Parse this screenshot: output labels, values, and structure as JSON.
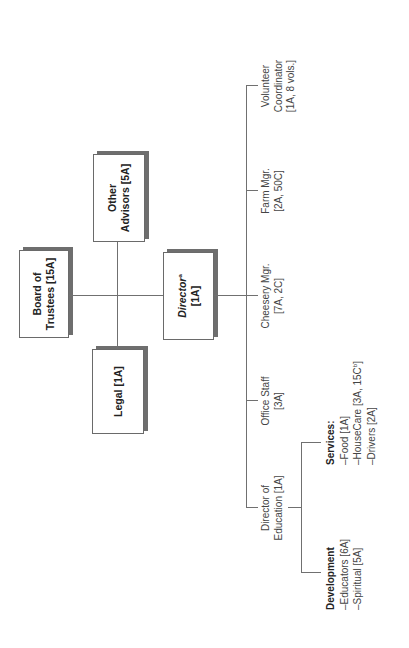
{
  "chart": {
    "orientation": "rotated-90-ccw",
    "top_nodes": {
      "board": {
        "line1": "Board of",
        "line2": "Trustees [15A]"
      },
      "other_advisors": {
        "line1": "Other",
        "line2": "Advisors [5A]"
      },
      "legal": {
        "line1": "Legal [1A]"
      },
      "director": {
        "title": "Director",
        "sup": "a",
        "line2": "[1A]"
      }
    },
    "branches": [
      {
        "line1": "Director of",
        "line2": "Education [1A]"
      },
      {
        "line1": "Office Staff",
        "line2": "[3A]"
      },
      {
        "line1": "Cheesery Mgr.",
        "line2": "[7A, 2C]"
      },
      {
        "line1": "Farm Mgr.",
        "line2": "[2A, 50C]"
      },
      {
        "line1": "Volunteer",
        "line2": "Coordinator",
        "line3": "[1A, 8 vols.]"
      }
    ],
    "education_groups": {
      "development": {
        "heading": "Development",
        "items": [
          "–Educators [6A]",
          "–Spiritual [5A]"
        ]
      },
      "services": {
        "heading": "Services:",
        "items": [
          "–Food [1A]",
          "–HouseCare [3A, 15C",
          "–Drivers [2A]"
        ],
        "housecare_sup": "b",
        "housecare_close": "]"
      }
    }
  },
  "colors": {
    "line": "#707070",
    "box_border": "#6a6a6a",
    "shadow": "#6e6e6e",
    "text": "#333333"
  }
}
